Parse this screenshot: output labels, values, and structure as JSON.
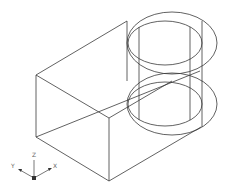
{
  "drawing": {
    "type": "isometric wireframe",
    "subject": "rectangular block with cylindrical boss and through-hole",
    "line_color": "#3a3a3a",
    "background": "#ffffff"
  },
  "ucs_icon": {
    "axes": [
      "Z",
      "Y",
      "X"
    ],
    "z_label": "Z",
    "y_label": "Y",
    "x_label": "X"
  }
}
